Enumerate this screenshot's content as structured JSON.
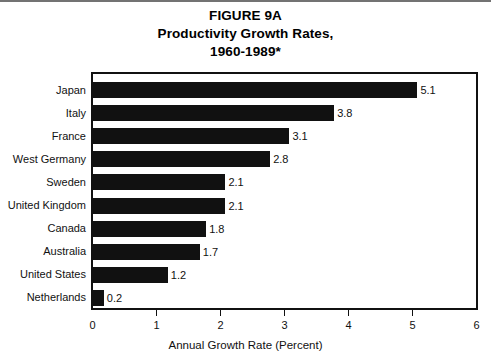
{
  "title": {
    "line1": "FIGURE 9A",
    "line2": "Productivity Growth Rates,",
    "line3": "1960-1989*"
  },
  "chart_data": {
    "type": "bar",
    "orientation": "horizontal",
    "title": "FIGURE 9A Productivity Growth Rates, 1960-1989*",
    "xlabel": "Annual Growth Rate (Percent)",
    "ylabel": "",
    "xlim": [
      0,
      6
    ],
    "xticks": [
      "0",
      "1",
      "2",
      "3",
      "4",
      "5",
      "6"
    ],
    "grid": false,
    "legend": false,
    "bar_color": "#111111",
    "categories": [
      "Japan",
      "Italy",
      "France",
      "West Germany",
      "Sweden",
      "United Kingdom",
      "Canada",
      "Australia",
      "United States",
      "Netherlands"
    ],
    "values": [
      5.1,
      3.8,
      3.1,
      2.8,
      2.1,
      2.1,
      1.8,
      1.7,
      1.2,
      0.2
    ],
    "value_labels": [
      "5.1",
      "3.8",
      "3.1",
      "2.8",
      "2.1",
      "2.1",
      "1.8",
      "1.7",
      "1.2",
      "0.2"
    ]
  }
}
